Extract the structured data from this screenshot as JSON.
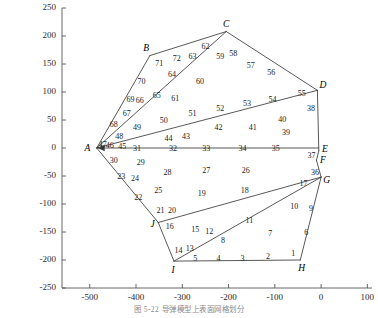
{
  "figure": {
    "caption": "图 5-22  导弹模型上表面网格划分",
    "axes": {
      "x": {
        "min": -560,
        "max": 110,
        "ticks": [
          -500,
          -400,
          -300,
          -200,
          -100,
          0,
          100
        ],
        "tick_labels": [
          "-500",
          "-400",
          "-300",
          "-200",
          "-100",
          "0",
          "100"
        ]
      },
      "y": {
        "min": -250,
        "max": 250,
        "ticks": [
          -250,
          -200,
          -150,
          -100,
          -50,
          0,
          50,
          100,
          150,
          200,
          250
        ],
        "tick_labels": [
          "-250",
          "-200",
          "-150",
          "-100",
          "-50",
          "0",
          "50",
          "100",
          "150",
          "200",
          "250"
        ]
      }
    },
    "line_color": "#3a3a3a",
    "axis_color": "#555555"
  },
  "chart_data": {
    "type": "scatter",
    "title": "",
    "xlabel": "",
    "ylabel": "",
    "xlim": [
      -560,
      110
    ],
    "ylim": [
      -250,
      250
    ],
    "grid": false,
    "legend": "none",
    "nodes": [
      {
        "label": "A",
        "x": -485,
        "y": 0,
        "lx": -505,
        "ly": 0
      },
      {
        "label": "B",
        "x": -370,
        "y": 165,
        "lx": -378,
        "ly": 178
      },
      {
        "label": "C",
        "x": -205,
        "y": 208,
        "lx": -205,
        "ly": 222
      },
      {
        "label": "D",
        "x": -8,
        "y": 103,
        "lx": 4,
        "ly": 112
      },
      {
        "label": "E",
        "x": -5,
        "y": -5,
        "lx": 8,
        "ly": -2
      },
      {
        "label": "F",
        "x": -10,
        "y": -22,
        "lx": 4,
        "ly": -22
      },
      {
        "label": "G",
        "x": 0,
        "y": -52,
        "lx": 12,
        "ly": -58
      },
      {
        "label": "H",
        "x": -45,
        "y": -200,
        "lx": -42,
        "ly": -214
      },
      {
        "label": "I",
        "x": -318,
        "y": -202,
        "lx": -320,
        "ly": -218
      },
      {
        "label": "J",
        "x": -352,
        "y": -133,
        "lx": -364,
        "ly": -136
      }
    ],
    "elements": [
      {
        "n": "1",
        "x": -60,
        "y": -188
      },
      {
        "n": "2",
        "x": -115,
        "y": -192
      },
      {
        "n": "3",
        "x": -170,
        "y": -196
      },
      {
        "n": "4",
        "x": -222,
        "y": -196
      },
      {
        "n": "5",
        "x": -272,
        "y": -196
      },
      {
        "n": "6",
        "x": -32,
        "y": -150
      },
      {
        "n": "7",
        "x": -110,
        "y": -152
      },
      {
        "n": "8",
        "x": -212,
        "y": -165
      },
      {
        "n": "9",
        "x": -22,
        "y": -108
      },
      {
        "n": "10",
        "x": -58,
        "y": -104
      },
      {
        "n": "11",
        "x": -155,
        "y": -128
      },
      {
        "n": "12",
        "x": -242,
        "y": -148
      },
      {
        "n": "13",
        "x": -284,
        "y": -178
      },
      {
        "n": "14",
        "x": -308,
        "y": -182
      },
      {
        "n": "15",
        "x": -272,
        "y": -144
      },
      {
        "n": "16",
        "x": -327,
        "y": -139
      },
      {
        "n": "17",
        "x": -38,
        "y": -62
      },
      {
        "n": "18",
        "x": -165,
        "y": -75
      },
      {
        "n": "19",
        "x": -258,
        "y": -80
      },
      {
        "n": "20",
        "x": -322,
        "y": -110
      },
      {
        "n": "21",
        "x": -347,
        "y": -110
      },
      {
        "n": "22",
        "x": -395,
        "y": -88
      },
      {
        "n": "23",
        "x": -432,
        "y": -50
      },
      {
        "n": "24",
        "x": -402,
        "y": -54
      },
      {
        "n": "25",
        "x": -352,
        "y": -75
      },
      {
        "n": "26",
        "x": -163,
        "y": -40
      },
      {
        "n": "27",
        "x": -248,
        "y": -40
      },
      {
        "n": "28",
        "x": -332,
        "y": -42
      },
      {
        "n": "29",
        "x": -390,
        "y": -25
      },
      {
        "n": "30",
        "x": -448,
        "y": -22
      },
      {
        "n": "31",
        "x": -398,
        "y": 0
      },
      {
        "n": "32",
        "x": -320,
        "y": 0
      },
      {
        "n": "33",
        "x": -248,
        "y": 0
      },
      {
        "n": "34",
        "x": -170,
        "y": 0
      },
      {
        "n": "35",
        "x": -98,
        "y": 0
      },
      {
        "n": "36",
        "x": -13,
        "y": -43
      },
      {
        "n": "37",
        "x": -21,
        "y": -12
      },
      {
        "n": "38",
        "x": -22,
        "y": 72
      },
      {
        "n": "39",
        "x": -76,
        "y": 28
      },
      {
        "n": "40",
        "x": -84,
        "y": 52
      },
      {
        "n": "41",
        "x": -148,
        "y": 38
      },
      {
        "n": "42",
        "x": -222,
        "y": 38
      },
      {
        "n": "43",
        "x": -292,
        "y": 22
      },
      {
        "n": "44",
        "x": -330,
        "y": 18
      },
      {
        "n": "45",
        "x": -430,
        "y": 3
      },
      {
        "n": "46",
        "x": -457,
        "y": 5
      },
      {
        "n": "47",
        "x": -472,
        "y": 7
      },
      {
        "n": "48",
        "x": -436,
        "y": 22
      },
      {
        "n": "49",
        "x": -398,
        "y": 38
      },
      {
        "n": "50",
        "x": -340,
        "y": 50
      },
      {
        "n": "51",
        "x": -278,
        "y": 63
      },
      {
        "n": "52",
        "x": -218,
        "y": 72
      },
      {
        "n": "53",
        "x": -160,
        "y": 80
      },
      {
        "n": "54",
        "x": -105,
        "y": 88
      },
      {
        "n": "55",
        "x": -42,
        "y": 98
      },
      {
        "n": "56",
        "x": -108,
        "y": 135
      },
      {
        "n": "57",
        "x": -152,
        "y": 148
      },
      {
        "n": "58",
        "x": -190,
        "y": 170
      },
      {
        "n": "59",
        "x": -218,
        "y": 165
      },
      {
        "n": "60",
        "x": -262,
        "y": 120
      },
      {
        "n": "61",
        "x": -315,
        "y": 90
      },
      {
        "n": "62",
        "x": -250,
        "y": 182
      },
      {
        "n": "63",
        "x": -278,
        "y": 165
      },
      {
        "n": "64",
        "x": -322,
        "y": 132
      },
      {
        "n": "65",
        "x": -355,
        "y": 95
      },
      {
        "n": "66",
        "x": -392,
        "y": 85
      },
      {
        "n": "67",
        "x": -420,
        "y": 62
      },
      {
        "n": "68",
        "x": -448,
        "y": 42
      },
      {
        "n": "69",
        "x": -412,
        "y": 88
      },
      {
        "n": "70",
        "x": -388,
        "y": 120
      },
      {
        "n": "71",
        "x": -350,
        "y": 152
      },
      {
        "n": "72",
        "x": -312,
        "y": 160
      }
    ],
    "edges": [
      {
        "from": "A",
        "to": "B"
      },
      {
        "from": "B",
        "to": "C"
      },
      {
        "from": "C",
        "to": "D"
      },
      {
        "from": "D",
        "to": "E"
      },
      {
        "from": "E",
        "to": "F"
      },
      {
        "from": "F",
        "to": "G"
      },
      {
        "from": "G",
        "to": "H"
      },
      {
        "from": "H",
        "to": "I"
      },
      {
        "from": "I",
        "to": "J"
      },
      {
        "from": "J",
        "to": "A"
      },
      {
        "from": "A",
        "to": "C_inner"
      },
      {
        "from": "A",
        "to": "D_inner"
      },
      {
        "from": "A",
        "to": "E_axis"
      },
      {
        "from": "J",
        "to": "G_inner"
      },
      {
        "from": "I",
        "to": "G_inner"
      }
    ]
  }
}
